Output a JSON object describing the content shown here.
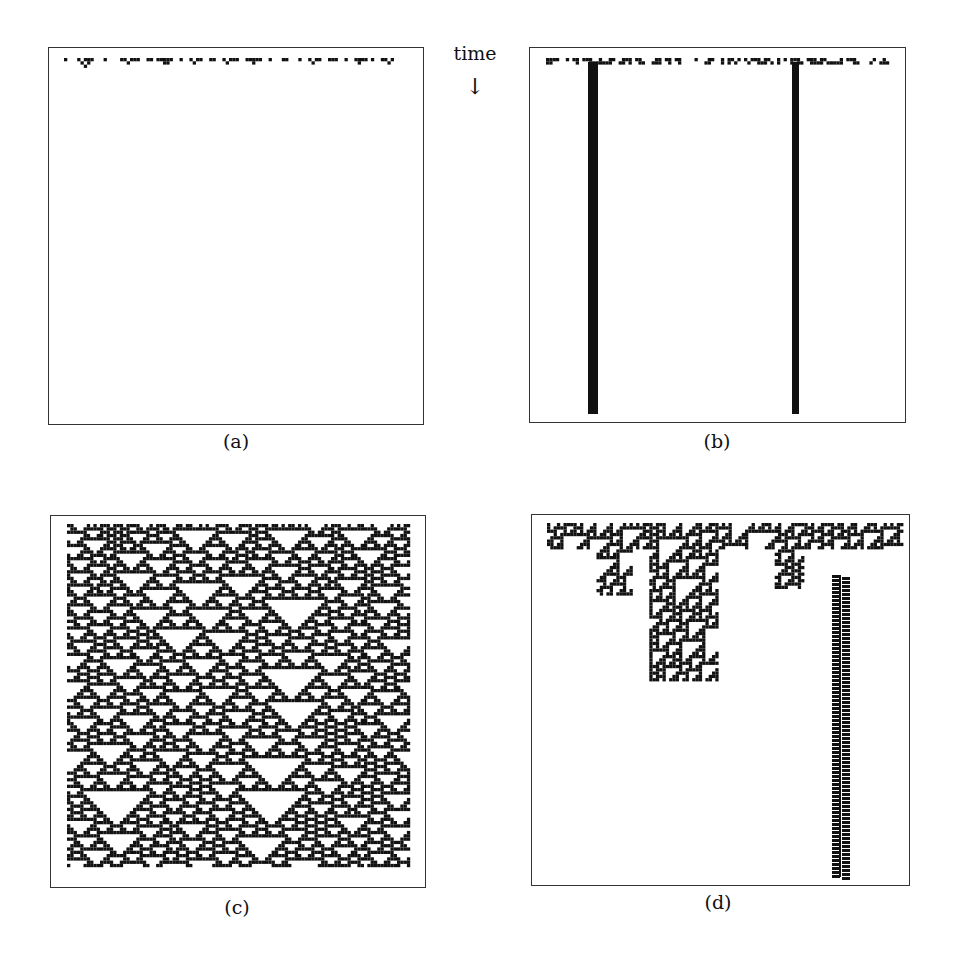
{
  "figure": {
    "time_axis": {
      "label": "time",
      "arrow": "↓",
      "direction": "down"
    },
    "panels": [
      {
        "id": "a",
        "caption": "(a)",
        "description": "random initial row that dies out almost immediately",
        "pattern": "dies-out"
      },
      {
        "id": "b",
        "caption": "(b)",
        "description": "random initial row settling into two fixed vertical stripes",
        "pattern": "fixed-stripes",
        "stripe_count": 2
      },
      {
        "id": "c",
        "caption": "(c)",
        "description": "chaotic field of nested white triangles on black",
        "pattern": "chaotic-triangles"
      },
      {
        "id": "d",
        "caption": "(d)",
        "description": "complex localized structures with one persistent propagating column",
        "pattern": "complex-localized"
      }
    ],
    "colors": {
      "ink": "#111111",
      "paper": "#ffffff",
      "frame": "#333333"
    }
  }
}
